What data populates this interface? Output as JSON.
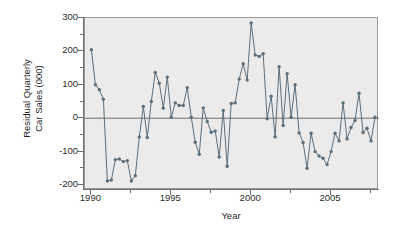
{
  "chart_data": {
    "type": "line",
    "title": "",
    "xlabel": "Year",
    "ylabel": "Residual Quarterly\nCar Sales (000)",
    "ylabel_line1": "Residual Quarterly",
    "ylabel_line2": "Car Sales (000)",
    "xlim": [
      1989.6,
      2008.0
    ],
    "ylim": [
      -215,
      300
    ],
    "grid": false,
    "legend": null,
    "marker": "filled-circle",
    "line_color": "#5d6e7b",
    "marker_color": "#5d6e7b",
    "panel_color": "#ebebeb",
    "axis_color": "#6f6f6f",
    "zero_line": 0,
    "y_ticks": [
      300,
      200,
      100,
      0,
      -100,
      -200
    ],
    "y_tick_labels": [
      "300",
      "200",
      "100",
      "0",
      "-100",
      "-200"
    ],
    "y_minor_ticks": [
      250,
      150,
      50,
      -50,
      -150
    ],
    "x_ticks": [
      1990,
      1995,
      2000,
      2005
    ],
    "x_tick_labels": [
      "1990",
      "1995",
      "2000",
      "2005"
    ],
    "x_minor_ticks": [
      1992.5,
      1997.5,
      2002.5,
      2007.5
    ],
    "series": [
      {
        "name": "Residual Quarterly Car Sales",
        "x": [
          1990.0,
          1990.25,
          1990.5,
          1990.75,
          1991.0,
          1991.25,
          1991.5,
          1991.75,
          1992.0,
          1992.25,
          1992.5,
          1992.75,
          1993.0,
          1993.25,
          1993.5,
          1993.75,
          1994.0,
          1994.25,
          1994.5,
          1994.75,
          1995.0,
          1995.25,
          1995.5,
          1995.75,
          1996.0,
          1996.25,
          1996.5,
          1996.75,
          1997.0,
          1997.25,
          1997.5,
          1997.75,
          1998.0,
          1998.25,
          1998.5,
          1998.75,
          1999.0,
          1999.25,
          1999.5,
          1999.75,
          2000.0,
          2000.25,
          2000.5,
          2000.75,
          2001.0,
          2001.25,
          2001.5,
          2001.75,
          2002.0,
          2002.25,
          2002.5,
          2002.75,
          2003.0,
          2003.25,
          2003.5,
          2003.75,
          2004.0,
          2004.25,
          2004.5,
          2004.75,
          2005.0,
          2005.25,
          2005.5,
          2005.75,
          2006.0,
          2006.25,
          2006.5,
          2006.75,
          2007.0,
          2007.25,
          2007.5,
          2007.75
        ],
        "values": [
          205,
          100,
          85,
          57,
          -188,
          -185,
          -124,
          -122,
          -130,
          -127,
          -188,
          -172,
          -56,
          35,
          -58,
          50,
          137,
          105,
          30,
          123,
          3,
          46,
          38,
          38,
          91,
          3,
          -72,
          -108,
          31,
          -10,
          -42,
          -38,
          -116,
          23,
          -144,
          44,
          46,
          117,
          163,
          114,
          285,
          189,
          185,
          193,
          -2,
          66,
          -56,
          154,
          -22,
          133,
          3,
          100,
          -44,
          -73,
          -150,
          -45,
          -100,
          -113,
          -120,
          -139,
          -100,
          -45,
          -68,
          46,
          -62,
          -28,
          -7,
          75,
          -43,
          -30,
          -68,
          3
        ]
      }
    ]
  }
}
